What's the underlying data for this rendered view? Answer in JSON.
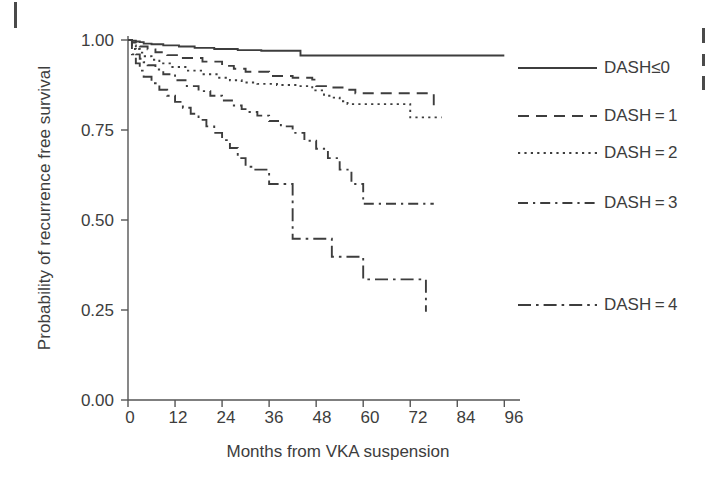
{
  "figure": {
    "type": "kaplan-meier-survival-plot",
    "background_color": "#ffffff",
    "line_color": "#3d3d3d",
    "axis_color": "#555555"
  },
  "axes": {
    "y_title": "Probability of recurrence free survival",
    "x_title": "Months from VKA suspension",
    "y_ticks": [
      "1.00",
      "0.75",
      "0.50",
      "0.25",
      "0.00"
    ],
    "x_ticks": [
      "0",
      "12",
      "24",
      "36",
      "48",
      "60",
      "72",
      "84",
      "96"
    ]
  },
  "legend": {
    "entries": [
      {
        "label": "DASH≤0",
        "style": "solid"
      },
      {
        "label": "DASH = 1",
        "style": "dashed"
      },
      {
        "label": "DASH = 2",
        "style": "dotted"
      },
      {
        "label": "DASH = 3",
        "style": "dashdot"
      },
      {
        "label": "DASH = 4",
        "style": "dashdot-long"
      }
    ]
  },
  "chart_data": {
    "type": "line",
    "title": "",
    "subtitle": "",
    "xlabel": "Months from VKA suspension",
    "ylabel": "Probability of recurrence free survival",
    "xlim": [
      0,
      100
    ],
    "ylim": [
      0.0,
      1.0
    ],
    "xticks": [
      0,
      12,
      24,
      36,
      48,
      60,
      72,
      84,
      96
    ],
    "yticks": [
      0.0,
      0.25,
      0.5,
      0.75,
      1.0
    ],
    "grid": false,
    "legend_position": "right",
    "step_shape": "post",
    "series": [
      {
        "name": "DASH≤0",
        "style": "solid",
        "x": [
          0,
          1,
          2,
          3,
          4,
          6,
          9,
          13,
          17,
          22,
          28,
          34,
          43,
          44,
          96
        ],
        "y": [
          1.0,
          0.998,
          0.996,
          0.994,
          0.99,
          0.988,
          0.985,
          0.982,
          0.978,
          0.975,
          0.972,
          0.97,
          0.97,
          0.957,
          0.957
        ]
      },
      {
        "name": "DASH = 1",
        "style": "dashed",
        "x": [
          0,
          1,
          2,
          3,
          5,
          7,
          10,
          14,
          19,
          24,
          27,
          30,
          36,
          42,
          47,
          48,
          52,
          56,
          58,
          74,
          78
        ],
        "y": [
          1.0,
          0.993,
          0.987,
          0.982,
          0.974,
          0.966,
          0.958,
          0.95,
          0.94,
          0.928,
          0.92,
          0.912,
          0.9,
          0.895,
          0.89,
          0.872,
          0.868,
          0.862,
          0.852,
          0.852,
          0.81
        ]
      },
      {
        "name": "DASH = 2",
        "style": "dotted",
        "x": [
          0,
          1,
          2,
          3,
          4,
          6,
          8,
          11,
          15,
          19,
          23,
          26,
          29,
          33,
          38,
          43,
          47,
          50,
          52,
          54,
          56,
          60,
          68,
          72,
          80
        ],
        "y": [
          1.0,
          0.985,
          0.975,
          0.965,
          0.955,
          0.945,
          0.935,
          0.925,
          0.915,
          0.905,
          0.895,
          0.888,
          0.882,
          0.878,
          0.875,
          0.872,
          0.86,
          0.845,
          0.84,
          0.83,
          0.822,
          0.822,
          0.822,
          0.785,
          0.785
        ]
      },
      {
        "name": "DASH = 3",
        "style": "dashdot",
        "x": [
          0,
          1,
          2,
          3,
          4,
          5,
          7,
          9,
          12,
          15,
          18,
          21,
          24,
          27,
          29,
          31,
          33,
          36,
          39,
          42,
          45,
          48,
          51,
          54,
          57,
          60,
          78
        ],
        "y": [
          1.0,
          0.975,
          0.96,
          0.948,
          0.938,
          0.93,
          0.918,
          0.905,
          0.888,
          0.872,
          0.858,
          0.845,
          0.832,
          0.818,
          0.808,
          0.8,
          0.79,
          0.775,
          0.76,
          0.742,
          0.72,
          0.698,
          0.672,
          0.64,
          0.6,
          0.545,
          0.545
        ]
      },
      {
        "name": "DASH = 4",
        "style": "dashdot-long",
        "x": [
          0,
          1,
          2,
          3,
          4,
          6,
          8,
          10,
          12,
          14,
          16,
          18,
          20,
          22,
          24,
          26,
          28,
          30,
          32,
          34,
          36,
          42,
          44,
          46,
          52,
          58,
          60,
          66,
          73,
          76
        ],
        "y": [
          1.0,
          0.96,
          0.935,
          0.915,
          0.898,
          0.88,
          0.862,
          0.845,
          0.828,
          0.812,
          0.795,
          0.778,
          0.76,
          0.742,
          0.722,
          0.7,
          0.672,
          0.648,
          0.64,
          0.64,
          0.6,
          0.448,
          0.448,
          0.448,
          0.398,
          0.398,
          0.335,
          0.335,
          0.335,
          0.245
        ]
      }
    ]
  }
}
